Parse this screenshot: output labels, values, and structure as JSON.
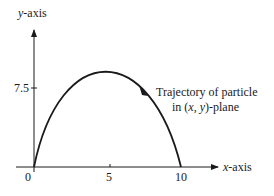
{
  "diagram": {
    "type": "projectile-trajectory",
    "axes": {
      "x_label_var": "x",
      "x_label_suffix": "-axis",
      "y_label_var": "y",
      "y_label_suffix": "-axis",
      "x_ticks": [
        "0",
        "5",
        "10"
      ],
      "y_ticks": [
        "7.5"
      ],
      "x_range": [
        0,
        10
      ],
      "y_peak": 7.5
    },
    "annotation": {
      "line1": "Trajectory of particle",
      "line2_prefix": "in (",
      "line2_x": "x",
      "line2_sep": ", ",
      "line2_y": "y",
      "line2_suffix": ")-plane"
    },
    "colors": {
      "ink": "#1a1a1a",
      "background": "#ffffff"
    }
  }
}
